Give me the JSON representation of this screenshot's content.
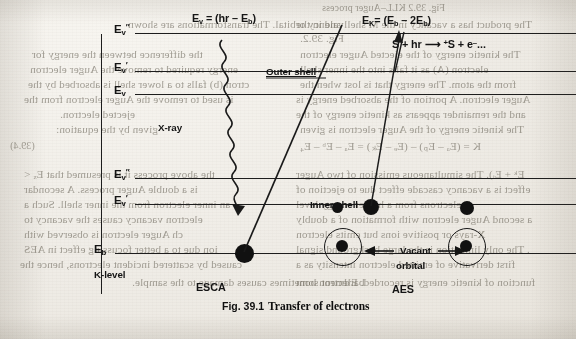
{
  "page": {
    "background_color": "#efece6",
    "ink_color": "#141414",
    "bleed_color": "#6f6a5e"
  },
  "figure": {
    "caption_number": "Fig. 39.1",
    "caption_text": "Transfer of electrons"
  },
  "diagram": {
    "equations": {
      "photoelectron": "E",
      "photoelectron_sub": "v",
      "photoelectron_rhs": "= (hr – E",
      "photoelectron_rhs_sub": "b",
      "photoelectron_rhs_end": ")",
      "photoelectron_full": "Ev = (hr – Eb)",
      "auger": "E",
      "auger_sub": "K",
      "auger_rhs": "= (E",
      "auger_rhs_sub1": "b",
      "auger_mid": " – 2E",
      "auger_rhs_sub2": "b",
      "auger_end": ")",
      "auger_full": "EK= (Eb – 2Eb)",
      "ionisation_full": "S + hr ⟶ ⁺S + e⁻..."
    },
    "level_labels": [
      {
        "name": "E_v_double_prime_upper",
        "base": "E",
        "sub": "v",
        "prime": "″"
      },
      {
        "name": "E_v_prime_upper",
        "base": "E",
        "sub": "v",
        "prime": "′"
      },
      {
        "name": "E_v_upper",
        "base": "E",
        "sub": "v",
        "prime": ""
      },
      {
        "name": "E_v_double_prime_lower",
        "base": "E",
        "sub": "v",
        "prime": "″"
      },
      {
        "name": "E_v_prime_lower",
        "base": "E",
        "sub": "v",
        "prime": "′"
      },
      {
        "name": "E_b_level",
        "base": "E",
        "sub": "b",
        "prime": ""
      }
    ],
    "annotations": {
      "xray": "X-ray",
      "outer_shell": "Outer shell",
      "inner_shell": "Inner shell",
      "k_level": "K-level",
      "esca": "ESCA",
      "aes": "AES",
      "vacant": "Vacant",
      "orbital": "orbital"
    }
  },
  "bleed_through": {
    "note": "mirrored show-through text from the reverse side of the scanned page",
    "lines": [
      {
        "text": "Fig. 39.2 KLL–Auger process",
        "x": 322,
        "y": 2,
        "size": "b10",
        "bold": false
      },
      {
        "text": "The product has a vacancy in the M shell and in the",
        "x": 296,
        "y": 18,
        "size": "b11",
        "bold": false
      },
      {
        "text": "Fig. 39.2.",
        "x": 300,
        "y": 32,
        "size": "b11",
        "bold": false
      },
      {
        "text": "valency orbital. The transformations are shown",
        "x": 128,
        "y": 18,
        "size": "b11",
        "bold": false
      },
      {
        "text": "The kinetic energy of the ejected Auger electron",
        "x": 300,
        "y": 48,
        "size": "b11",
        "bold": false
      },
      {
        "text": "the difference between the energy for",
        "x": 32,
        "y": 48,
        "size": "b11",
        "bold": false
      },
      {
        "text": "energy required to remove the Auger electron",
        "x": 30,
        "y": 63,
        "size": "b11",
        "bold": false
      },
      {
        "text": "electron (A) as it falls into the inner shell",
        "x": 300,
        "y": 63,
        "size": "b11",
        "bold": false
      },
      {
        "text": "ctron (b) falls to a lower shell is absorbed by the",
        "x": 28,
        "y": 78,
        "size": "b11",
        "bold": false
      },
      {
        "text": "from the atom. The energy that is lost when the",
        "x": 300,
        "y": 78,
        "size": "b11",
        "bold": false
      },
      {
        "text": "is used to remove the Auger electron from the",
        "x": 24,
        "y": 93,
        "size": "b11",
        "bold": false
      },
      {
        "text": "Auger electron. A portion of the absorbed energy is",
        "x": 296,
        "y": 93,
        "size": "b11",
        "bold": false
      },
      {
        "text": "ejected electron.",
        "x": 60,
        "y": 108,
        "size": "b11",
        "bold": false
      },
      {
        "text": "and the remainder appears as kinetic energy of the",
        "x": 296,
        "y": 108,
        "size": "b11",
        "bold": false
      },
      {
        "text": "given by the equation:",
        "x": 56,
        "y": 123,
        "size": "b11",
        "bold": false
      },
      {
        "text": "The kinetic energy of the Auger electron is given",
        "x": 300,
        "y": 123,
        "size": "b11",
        "bold": false
      },
      {
        "text": "(39.4)",
        "x": 10,
        "y": 140,
        "size": "b10",
        "bold": false
      },
      {
        "text": "K = (Eₐ – Eₚ) – (Eₑ – Eₖ) = Eₐ – Eᵇ – E₄",
        "x": 300,
        "y": 140,
        "size": "b11",
        "bold": false
      },
      {
        "text": "Eᵏ + Eᵢ). The simultaneous emission of two Auger",
        "x": 296,
        "y": 168,
        "size": "b11",
        "bold": false
      },
      {
        "text": "the above process it is presumed that Eₓ <",
        "x": 24,
        "y": 168,
        "size": "b11",
        "bold": false
      },
      {
        "text": "effect is a vacancy cascade effect due to ejection of",
        "x": 296,
        "y": 183,
        "size": "b11",
        "bold": false
      },
      {
        "text": "is a double Auger process. A secondar",
        "x": 24,
        "y": 183,
        "size": "b11",
        "bold": false
      },
      {
        "text": "it electrons from a higher energy level",
        "x": 296,
        "y": 198,
        "size": "b11",
        "bold": false
      },
      {
        "text": "an inner electron from the inner shell. Such a",
        "x": 24,
        "y": 198,
        "size": "b11",
        "bold": false
      },
      {
        "text": "a second Auger electron with formation of a doubly",
        "x": 296,
        "y": 213,
        "size": "b11",
        "bold": false
      },
      {
        "text": "electron vacancy causes the vacancy to",
        "x": 24,
        "y": 213,
        "size": "b11",
        "bold": false
      },
      {
        "text": "X-rays or positive ions but emits electron",
        "x": 296,
        "y": 228,
        "size": "b11",
        "bold": false
      },
      {
        "text": "ch Auger electron is observed with",
        "x": 24,
        "y": 228,
        "size": "b11",
        "bold": false
      },
      {
        "text": ". The only limitation is the large background signal",
        "x": 296,
        "y": 243,
        "size": "b11",
        "bold": false
      },
      {
        "text": "ion due to a better focussing effect in AES",
        "x": 24,
        "y": 243,
        "size": "b11",
        "bold": false
      },
      {
        "text": "first derivative of emitted electron intensity as a",
        "x": 296,
        "y": 258,
        "size": "b11",
        "bold": false
      },
      {
        "text": "caused by scattered incident electrons, hence the",
        "x": 20,
        "y": 258,
        "size": "b11",
        "bold": false
      },
      {
        "text": "function of kinetic energy is recorded. Electron bom",
        "x": 296,
        "y": 276,
        "size": "b11",
        "bold": false
      },
      {
        "text": "bardment sometimes causes damage to the sample.",
        "x": 132,
        "y": 276,
        "size": "b11",
        "bold": false
      }
    ]
  }
}
